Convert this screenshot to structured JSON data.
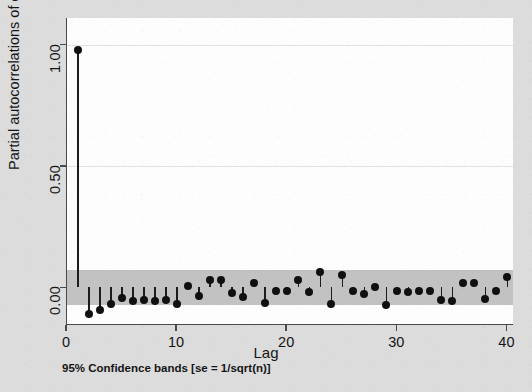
{
  "figure": {
    "y_axis_title": "Partial autocorrelations of e",
    "x_axis_title": "Lag",
    "footnote": "95% Confidence bands [se = 1/sqrt(n)]",
    "marker_color": "#101010",
    "band_color": "#c2c2c2",
    "background_color": "#dcdcdc",
    "plot_background_color": "#fdfdfd"
  },
  "chart_data": {
    "type": "bar",
    "subtype": "stem-lollipop-correlogram",
    "title": "",
    "xlabel": "Lag",
    "ylabel": "Partial autocorrelations of e",
    "xlim": [
      0,
      40.6
    ],
    "ylim": [
      -0.155,
      1.11
    ],
    "xticks": [
      0,
      10,
      20,
      30,
      40
    ],
    "xtick_labels": [
      "0",
      "10",
      "20",
      "30",
      "40"
    ],
    "yticks": [
      0.0,
      0.5,
      1.0
    ],
    "ytick_labels": [
      "0.00",
      "0.50",
      "1.00"
    ],
    "grid": true,
    "legend": "none",
    "annotation": "95% Confidence bands [se = 1/sqrt(n)]",
    "confidence_band": {
      "label": "95% confidence band",
      "upper": 0.072,
      "lower": -0.072,
      "se_formula": "1/sqrt(n)"
    },
    "baseline": 0.0,
    "categories": [
      1,
      2,
      3,
      4,
      5,
      6,
      7,
      8,
      9,
      10,
      11,
      12,
      13,
      14,
      15,
      16,
      17,
      18,
      19,
      20,
      21,
      22,
      23,
      24,
      25,
      26,
      27,
      28,
      29,
      30,
      31,
      32,
      33,
      34,
      35,
      36,
      37,
      38,
      39,
      40
    ],
    "values": [
      0.98,
      -0.11,
      -0.095,
      -0.07,
      -0.045,
      -0.055,
      -0.052,
      -0.055,
      -0.053,
      -0.068,
      0.007,
      -0.035,
      0.03,
      0.031,
      -0.022,
      -0.04,
      0.018,
      -0.066,
      -0.014,
      -0.014,
      0.031,
      -0.02,
      0.062,
      -0.068,
      0.052,
      -0.016,
      -0.026,
      0.002,
      -0.072,
      -0.014,
      -0.017,
      -0.014,
      -0.014,
      -0.05,
      -0.058,
      0.02,
      0.019,
      -0.048,
      -0.013,
      0.042
    ]
  }
}
